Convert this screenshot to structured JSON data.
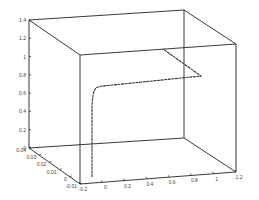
{
  "chart_data": {
    "type": "line",
    "projection": "3d",
    "title": "",
    "xlabel": "",
    "ylabel": "",
    "zlabel": "",
    "grid": false,
    "legend": null,
    "xlim": [
      -0.2,
      1.2
    ],
    "ylim": [
      -0.01,
      0.04
    ],
    "zlim": [
      0,
      1.4
    ],
    "x_ticks": [
      "-0.2",
      "0",
      "0.2",
      "0.4",
      "0.6",
      "0.8",
      "1",
      "1.2"
    ],
    "y_ticks": [
      "0.04",
      "0.03",
      "0.02",
      "0.01",
      "0",
      "-0.01"
    ],
    "z_ticks": [
      "0",
      "0.2",
      "0.4",
      "0.6",
      "0.8",
      "1",
      "1.2",
      "1.4"
    ],
    "series": [
      {
        "name": "trajectory",
        "points": [
          {
            "x": -0.12,
            "y": 0.0,
            "z": 0.0
          },
          {
            "x": -0.12,
            "y": 0.0,
            "z": 0.3
          },
          {
            "x": -0.12,
            "y": 0.0,
            "z": 0.6
          },
          {
            "x": -0.11,
            "y": 0.0,
            "z": 0.85
          },
          {
            "x": -0.08,
            "y": 0.0,
            "z": 0.9
          },
          {
            "x": 0.4,
            "y": 0.0,
            "z": 0.95
          },
          {
            "x": 0.9,
            "y": 0.0,
            "z": 1.0
          },
          {
            "x": 0.9,
            "y": 0.02,
            "z": 1.02
          },
          {
            "x": 0.85,
            "y": 0.04,
            "z": 1.05
          }
        ]
      }
    ]
  }
}
